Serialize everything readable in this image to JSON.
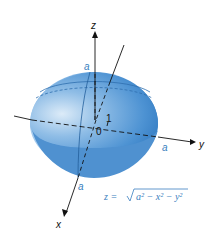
{
  "diagram": {
    "axes": {
      "z": "z",
      "y": "y",
      "x": "x"
    },
    "labels": {
      "origin": "0",
      "unit": "1",
      "a_top": "a",
      "a_y": "a",
      "a_x": "a"
    },
    "equation": {
      "lhs": "z = ",
      "radicand": "a² − x² − y²"
    },
    "colors": {
      "surface_light": "#cfe3f5",
      "surface_mid": "#6aa6dc",
      "surface_dark": "#2f78c0",
      "label_blue": "#3a7fc0",
      "axis": "#111111"
    }
  }
}
